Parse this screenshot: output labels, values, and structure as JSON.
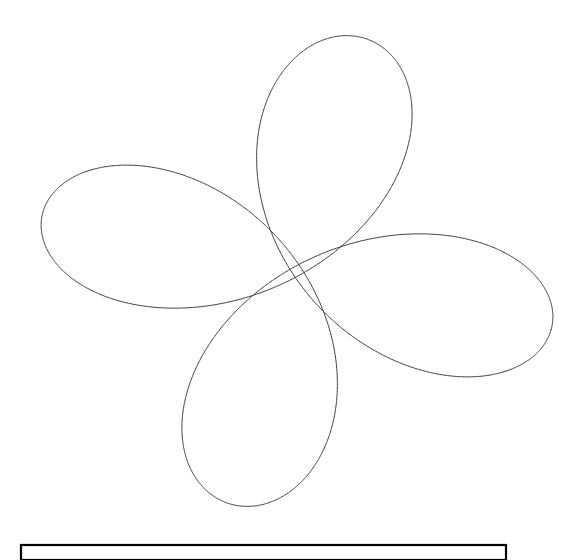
{
  "canvas": {
    "width": 579,
    "height": 560,
    "background_color": "#ffffff"
  },
  "figure": {
    "title": "",
    "caption": "",
    "stroke_color": "#3a3a3a",
    "stroke_width": 1,
    "box_stroke_color": "#000000"
  },
  "legend_box": {
    "x": 21,
    "y": 545,
    "width": 485,
    "height": 15,
    "label": "",
    "clipped_at_bottom": true
  },
  "chart_data": {
    "type": "line",
    "title": "",
    "subtitle": "",
    "xlabel": "",
    "ylabel": "",
    "grid": false,
    "legend_position": "none",
    "curve_family": "hypotrochoid",
    "parameters": {
      "R": 1.0,
      "r": 0.25,
      "d": 0.78,
      "loops": 4,
      "t_start": 0.0,
      "t_end": 6.2832,
      "samples": 2000
    },
    "transform": {
      "center_x": 297,
      "center_y": 271,
      "scale_x": 262,
      "scale_y": 241,
      "rotation_deg": -14
    },
    "extents": {
      "x_min": 38,
      "x_max": 556,
      "y_min": 30,
      "y_max": 512
    },
    "loop_centers": [
      {
        "x": 349,
        "y": 160,
        "label": "loop-upper-right"
      },
      {
        "x": 120,
        "y": 280,
        "label": "loop-left"
      },
      {
        "x": 342,
        "y": 420,
        "label": "loop-lower"
      },
      {
        "x": 548,
        "y": 268,
        "label": "loop-right-open"
      }
    ],
    "xlim": [
      0,
      579
    ],
    "ylim": [
      0,
      560
    ],
    "x": [],
    "values": []
  }
}
